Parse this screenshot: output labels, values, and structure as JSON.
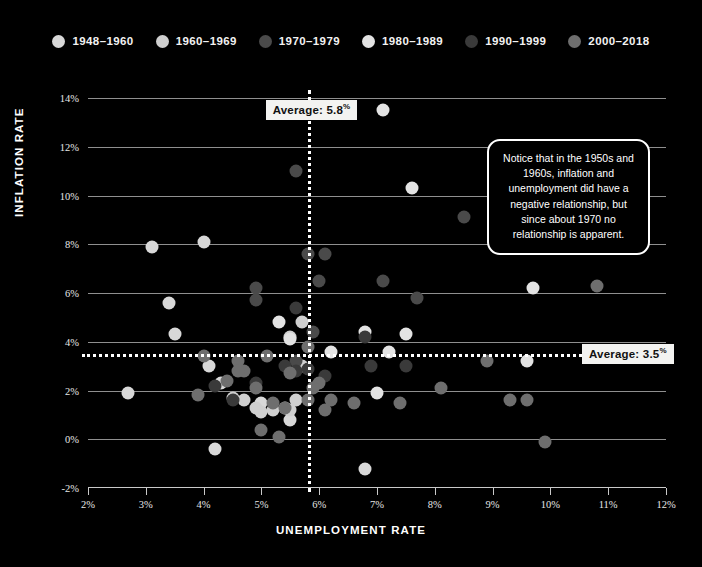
{
  "legend": {
    "items": [
      {
        "label": "1948–1960",
        "color": "#d8d8d8"
      },
      {
        "label": "1960–1969",
        "color": "#cfcfcf"
      },
      {
        "label": "1970–1979",
        "color": "#4a4a4a"
      },
      {
        "label": "1980–1989",
        "color": "#e3e3e3"
      },
      {
        "label": "1990–1999",
        "color": "#3a3a3a"
      },
      {
        "label": "2000–2018",
        "color": "#6e6e6e"
      }
    ]
  },
  "annotation": {
    "text": "Notice that in the 1950s and 1960s, inflation and unemployment did have a negative relationship, but since about 1970 no relationship is apparent."
  },
  "averages": {
    "unemployment_label": "Average: 5.8",
    "unemployment_suffix": "%",
    "inflation_label": "Average: 3.5",
    "inflation_suffix": "%"
  },
  "chart_data": {
    "type": "scatter",
    "title": "",
    "xlabel": "UNEMPLOYMENT RATE",
    "ylabel": "INFLATION RATE",
    "xlim": [
      2,
      12
    ],
    "ylim": [
      -2,
      14
    ],
    "xticks": [
      "2%",
      "3%",
      "4%",
      "5%",
      "6%",
      "7%",
      "8%",
      "9%",
      "10%",
      "11%",
      "12%"
    ],
    "xtick_values": [
      2,
      3,
      4,
      5,
      6,
      7,
      8,
      9,
      10,
      11,
      12
    ],
    "yticks": [
      "-2%",
      "0%",
      "2%",
      "4%",
      "6%",
      "8%",
      "10%",
      "12%",
      "14%"
    ],
    "ytick_values": [
      -2,
      0,
      2,
      4,
      6,
      8,
      10,
      12,
      14
    ],
    "grid": "horizontal",
    "legend_position": "top-center",
    "background": "#000000",
    "reference_lines": [
      {
        "orientation": "vertical",
        "value": 5.8,
        "style": "dotted",
        "color": "#ffffff",
        "label": "Average: 5.8%"
      },
      {
        "orientation": "horizontal",
        "value": 3.5,
        "style": "dotted",
        "color": "#ffffff",
        "label": "Average: 3.5%"
      }
    ],
    "series": [
      {
        "name": "1948–1960",
        "color": "#d8d8d8",
        "points": [
          {
            "x": 2.7,
            "y": 1.9
          },
          {
            "x": 3.1,
            "y": 7.9
          },
          {
            "x": 3.4,
            "y": 5.6
          },
          {
            "x": 3.5,
            "y": 4.3
          },
          {
            "x": 4.0,
            "y": 8.1
          },
          {
            "x": 4.1,
            "y": 3.0
          },
          {
            "x": 4.2,
            "y": -0.4
          },
          {
            "x": 4.3,
            "y": 2.3
          },
          {
            "x": 5.0,
            "y": 1.5
          },
          {
            "x": 5.5,
            "y": 0.8
          },
          {
            "x": 6.8,
            "y": -1.2
          }
        ]
      },
      {
        "name": "1960–1969",
        "color": "#cfcfcf",
        "points": [
          {
            "x": 4.5,
            "y": 1.7
          },
          {
            "x": 4.7,
            "y": 1.6
          },
          {
            "x": 4.9,
            "y": 1.3
          },
          {
            "x": 5.0,
            "y": 1.1
          },
          {
            "x": 5.2,
            "y": 1.2
          },
          {
            "x": 5.4,
            "y": 1.3
          },
          {
            "x": 5.5,
            "y": 1.2
          },
          {
            "x": 5.6,
            "y": 1.6
          },
          {
            "x": 5.7,
            "y": 3.0
          },
          {
            "x": 5.5,
            "y": 4.2
          },
          {
            "x": 5.7,
            "y": 4.8
          }
        ]
      },
      {
        "name": "1970–1979",
        "color": "#4a4a4a",
        "points": [
          {
            "x": 4.9,
            "y": 5.7
          },
          {
            "x": 5.9,
            "y": 4.4
          },
          {
            "x": 5.6,
            "y": 3.2
          },
          {
            "x": 4.9,
            "y": 6.2
          },
          {
            "x": 5.6,
            "y": 11.0
          },
          {
            "x": 8.5,
            "y": 9.1
          },
          {
            "x": 7.7,
            "y": 5.8
          },
          {
            "x": 7.1,
            "y": 6.5
          },
          {
            "x": 6.1,
            "y": 7.6
          },
          {
            "x": 6.0,
            "y": 6.5
          },
          {
            "x": 5.8,
            "y": 7.6
          }
        ]
      },
      {
        "name": "1980–1989",
        "color": "#e3e3e3",
        "points": [
          {
            "x": 7.1,
            "y": 13.5
          },
          {
            "x": 7.6,
            "y": 10.3
          },
          {
            "x": 9.7,
            "y": 6.2
          },
          {
            "x": 9.6,
            "y": 3.2
          },
          {
            "x": 7.5,
            "y": 4.3
          },
          {
            "x": 7.2,
            "y": 3.6
          },
          {
            "x": 7.0,
            "y": 1.9
          },
          {
            "x": 6.2,
            "y": 3.6
          },
          {
            "x": 5.5,
            "y": 4.1
          },
          {
            "x": 5.3,
            "y": 4.8
          },
          {
            "x": 6.8,
            "y": 4.4
          }
        ]
      },
      {
        "name": "1990–1999",
        "color": "#3a3a3a",
        "points": [
          {
            "x": 5.6,
            "y": 5.4
          },
          {
            "x": 6.8,
            "y": 4.2
          },
          {
            "x": 7.5,
            "y": 3.0
          },
          {
            "x": 6.9,
            "y": 3.0
          },
          {
            "x": 6.1,
            "y": 2.6
          },
          {
            "x": 5.6,
            "y": 2.8
          },
          {
            "x": 5.4,
            "y": 3.0
          },
          {
            "x": 4.9,
            "y": 2.3
          },
          {
            "x": 4.5,
            "y": 1.6
          },
          {
            "x": 4.2,
            "y": 2.2
          },
          {
            "x": 5.8,
            "y": 2.9
          }
        ]
      },
      {
        "name": "2000–2018",
        "color": "#6e6e6e",
        "points": [
          {
            "x": 4.0,
            "y": 3.4
          },
          {
            "x": 4.7,
            "y": 2.8
          },
          {
            "x": 5.8,
            "y": 1.6
          },
          {
            "x": 6.0,
            "y": 2.3
          },
          {
            "x": 5.5,
            "y": 2.7
          },
          {
            "x": 5.1,
            "y": 3.4
          },
          {
            "x": 4.6,
            "y": 3.2
          },
          {
            "x": 4.6,
            "y": 2.8
          },
          {
            "x": 5.8,
            "y": 3.8
          },
          {
            "x": 9.3,
            "y": 1.6
          },
          {
            "x": 9.6,
            "y": 1.6
          },
          {
            "x": 8.9,
            "y": 3.2
          },
          {
            "x": 8.1,
            "y": 2.1
          },
          {
            "x": 7.4,
            "y": 1.5
          },
          {
            "x": 6.2,
            "y": 1.6
          },
          {
            "x": 5.3,
            "y": 0.1
          },
          {
            "x": 5.4,
            "y": 1.3
          },
          {
            "x": 4.9,
            "y": 2.1
          },
          {
            "x": 4.4,
            "y": 2.4
          },
          {
            "x": 3.9,
            "y": 1.8
          },
          {
            "x": 10.8,
            "y": 6.3
          },
          {
            "x": 9.9,
            "y": -0.1
          },
          {
            "x": 6.1,
            "y": 1.2
          },
          {
            "x": 5.9,
            "y": 2.1
          },
          {
            "x": 6.6,
            "y": 1.5
          },
          {
            "x": 5.2,
            "y": 1.5
          },
          {
            "x": 5.0,
            "y": 0.4
          }
        ]
      }
    ]
  }
}
